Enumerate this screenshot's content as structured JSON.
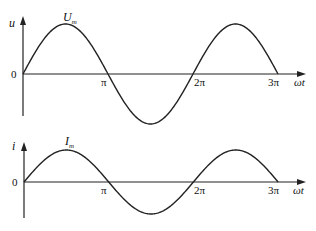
{
  "diagram": {
    "panels": [
      {
        "id": "voltage",
        "y_label": "u",
        "peak_label": "U",
        "peak_subscript": "m",
        "origin_label": "0",
        "x_ticks": [
          "π",
          "2π",
          "3π"
        ],
        "x_label": "ωt"
      },
      {
        "id": "current",
        "y_label": "i",
        "peak_label": "I",
        "peak_subscript": "m",
        "origin_label": "0",
        "x_ticks": [
          "π",
          "2π",
          "3π"
        ],
        "x_label": "ωt"
      }
    ]
  },
  "chart_data": [
    {
      "type": "line",
      "title": "",
      "xlabel": "ωt",
      "ylabel": "u",
      "x_ticks": [
        "0",
        "π",
        "2π",
        "3π"
      ],
      "series": [
        {
          "name": "u = U_m sin ωt",
          "function": "U_m*sin(x)",
          "x_range": [
            0,
            9.42
          ],
          "amplitude_label": "U_m"
        }
      ]
    },
    {
      "type": "line",
      "title": "",
      "xlabel": "ωt",
      "ylabel": "i",
      "x_ticks": [
        "0",
        "π",
        "2π",
        "3π"
      ],
      "series": [
        {
          "name": "i = I_m sin ωt",
          "function": "I_m*sin(x)",
          "x_range": [
            0,
            9.42
          ],
          "amplitude_label": "I_m"
        }
      ]
    }
  ]
}
